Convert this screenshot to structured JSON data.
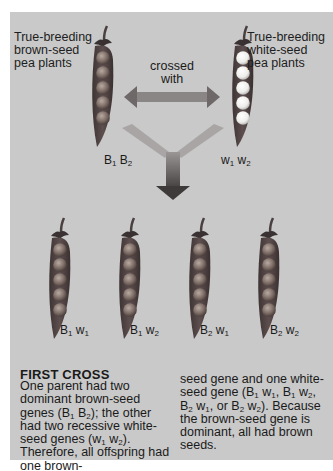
{
  "parents": {
    "left": {
      "label_lines": [
        "True-breeding",
        "brown-seed",
        "pea plants"
      ],
      "genotype": [
        {
          "allele": "B",
          "sub": "1"
        },
        {
          "allele": "B",
          "sub": "2"
        }
      ],
      "seed_color": "brown",
      "seed_count": 5
    },
    "right": {
      "label_lines": [
        "True-breeding",
        "white-seed",
        "pea plants"
      ],
      "genotype": [
        {
          "allele": "w",
          "sub": "1"
        },
        {
          "allele": "w",
          "sub": "2"
        }
      ],
      "seed_color": "white",
      "seed_count": 5
    },
    "cross_label_lines": [
      "crossed",
      "with"
    ]
  },
  "offspring": [
    {
      "genotype": [
        {
          "allele": "B",
          "sub": "1"
        },
        {
          "allele": "w",
          "sub": "1"
        }
      ],
      "seed_color": "brown",
      "seed_count": 5
    },
    {
      "genotype": [
        {
          "allele": "B",
          "sub": "1"
        },
        {
          "allele": "w",
          "sub": "2"
        }
      ],
      "seed_color": "brown",
      "seed_count": 5
    },
    {
      "genotype": [
        {
          "allele": "B",
          "sub": "2"
        },
        {
          "allele": "w",
          "sub": "1"
        }
      ],
      "seed_color": "brown",
      "seed_count": 5
    },
    {
      "genotype": [
        {
          "allele": "B",
          "sub": "2"
        },
        {
          "allele": "w",
          "sub": "2"
        }
      ],
      "seed_color": "brown",
      "seed_count": 5
    }
  ],
  "caption": {
    "title": "FIRST CROSS",
    "col1": "One parent had two dominant brown-seed genes (B<sub>1</sub> B<sub>2</sub>); the other had two recessive white-seed genes (w<sub>1</sub> w<sub>2</sub>). Therefore, all offspring had one brown-",
    "col2": "seed gene and one white-seed gene (B<sub>1</sub> w<sub>1</sub>, B<sub>1</sub> w<sub>2</sub>, B<sub>2</sub> w<sub>1</sub>, or B<sub>2</sub> w<sub>2</sub>). Because the brown-seed gene is dominant, all had brown seeds."
  },
  "colors": {
    "panel": "#c9c9c9",
    "pod": "#5a4a4a",
    "brown_seed": "#8a7a72",
    "white_seed": "#f4f4f2",
    "arrow": "#6e6a6a"
  }
}
